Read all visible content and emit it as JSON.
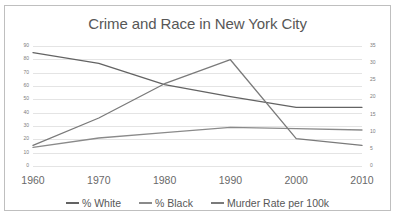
{
  "chart_data": {
    "type": "line",
    "title": "Crime and Race in New York City",
    "xlabel": "",
    "ylabel": "",
    "grid": true,
    "legend_position": "bottom",
    "categories": [
      "1960",
      "1970",
      "1980",
      "1990",
      "2000",
      "2010"
    ],
    "axes": {
      "left": {
        "ylim": [
          0,
          90
        ],
        "ticks": [
          "90",
          "80",
          "70",
          "60",
          "50",
          "40",
          "30",
          "20",
          "10",
          "0"
        ],
        "tick_values": [
          90,
          80,
          70,
          60,
          50,
          40,
          30,
          20,
          10,
          0
        ]
      },
      "right": {
        "ylim": [
          0,
          35
        ],
        "ticks": [
          "35",
          "30",
          "25",
          "20",
          "15",
          "10",
          "5",
          "0"
        ],
        "tick_values": [
          35,
          30,
          25,
          20,
          15,
          10,
          5,
          0
        ]
      }
    },
    "series": [
      {
        "name": "% White",
        "axis": "left",
        "color": "#636363",
        "values": [
          85,
          77,
          61,
          52,
          44,
          44
        ]
      },
      {
        "name": "% Black",
        "axis": "left",
        "color": "#8a8a8a",
        "values": [
          14,
          21,
          25,
          29,
          28,
          27
        ]
      },
      {
        "name": "Murder Rate per 100k",
        "axis": "right",
        "color": "#7a7a7a",
        "values": [
          6,
          14,
          24,
          31,
          8,
          6
        ]
      }
    ]
  },
  "legend": {
    "items": [
      {
        "label": "% White"
      },
      {
        "label": "% Black"
      },
      {
        "label": "Murder Rate per 100k"
      }
    ]
  }
}
